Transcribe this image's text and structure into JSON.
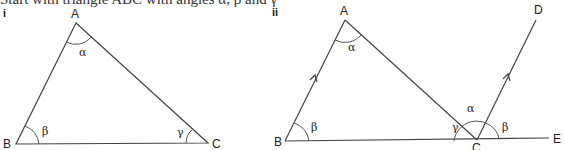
{
  "cutoff_text": "Start with triangle ABC with angles α, β and γ",
  "figure_i": {
    "numeral": "i",
    "vertices": {
      "A": "A",
      "B": "B",
      "C": "C"
    },
    "angles": {
      "at_A": "α",
      "at_B": "β",
      "at_C": "γ"
    }
  },
  "figure_ii": {
    "numeral": "ii",
    "vertices": {
      "A": "A",
      "B": "B",
      "C": "C",
      "D": "D",
      "E": "E"
    },
    "angles": {
      "at_A": "α",
      "at_B": "β",
      "at_C_interior": "γ",
      "at_C_middle": "α",
      "at_C_right": "β"
    }
  }
}
